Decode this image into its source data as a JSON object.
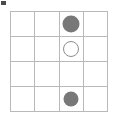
{
  "figure": {
    "type": "grid-marker-diagram",
    "grid": {
      "rows": 4,
      "columns": 4,
      "line_color": "#b9b9b9",
      "cell_background": "#ffffff"
    },
    "marker_styles": {
      "filled_color": "#787878",
      "hollow_stroke_color": "#8d8d8d",
      "hollow_fill_color": "#ffffff"
    },
    "cells": [
      [
        {
          "row": 1,
          "col": 1,
          "marker": "none"
        },
        {
          "row": 1,
          "col": 2,
          "marker": "none"
        },
        {
          "row": 1,
          "col": 3,
          "marker": "filled"
        },
        {
          "row": 1,
          "col": 4,
          "marker": "none"
        }
      ],
      [
        {
          "row": 2,
          "col": 1,
          "marker": "none"
        },
        {
          "row": 2,
          "col": 2,
          "marker": "none"
        },
        {
          "row": 2,
          "col": 3,
          "marker": "hollow"
        },
        {
          "row": 2,
          "col": 4,
          "marker": "none"
        }
      ],
      [
        {
          "row": 3,
          "col": 1,
          "marker": "none"
        },
        {
          "row": 3,
          "col": 2,
          "marker": "none"
        },
        {
          "row": 3,
          "col": 3,
          "marker": "none"
        },
        {
          "row": 3,
          "col": 4,
          "marker": "none"
        }
      ],
      [
        {
          "row": 4,
          "col": 1,
          "marker": "none"
        },
        {
          "row": 4,
          "col": 2,
          "marker": "none"
        },
        {
          "row": 4,
          "col": 3,
          "marker": "filled-small"
        },
        {
          "row": 4,
          "col": 4,
          "marker": "none"
        }
      ]
    ],
    "corner_mark": {
      "present": true,
      "color": "#4a4a4a"
    }
  }
}
